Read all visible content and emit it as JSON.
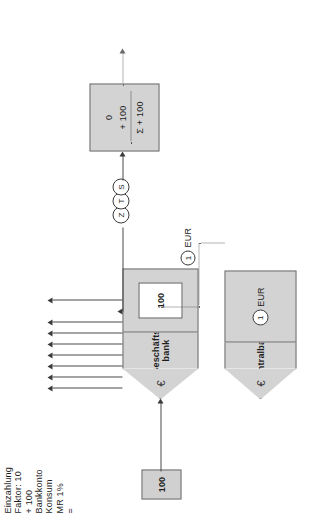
{
  "diagram": {
    "currency_symbol": "€",
    "commercial_bank": {
      "name_line1": "Geschäfts-",
      "name_line2": "bank",
      "reserve_value": "100",
      "euro": "€"
    },
    "central_bank": {
      "name": "Zentralbank",
      "euro": "€",
      "amount_circle": "1",
      "amount_unit": "EUR"
    },
    "deposit": {
      "label": "Einzahlung",
      "value": "100"
    },
    "multiplier": {
      "label": "Faktor: 10",
      "arrow_count": 8
    },
    "minimum_reserve": {
      "label": "MR 1%",
      "equals": "=",
      "circle": "1",
      "unit": "EUR"
    },
    "payment_chain": {
      "amount": "+ 100",
      "steps": [
        "Z",
        "T",
        "S"
      ]
    },
    "bank_account": {
      "label": "Bankkonto",
      "row_opening": "0",
      "row_credit": "+ 100",
      "row_sum": "Σ + 100"
    },
    "consumption": {
      "label": "Konsum"
    },
    "colors": {
      "shape_fill": "#d3d3d3",
      "shape_stroke": "#6e6e6e",
      "line": "#4a4a4a",
      "dotted": "#6a6a6a",
      "text": "#1d1d1d",
      "background": "#ffffff"
    }
  }
}
